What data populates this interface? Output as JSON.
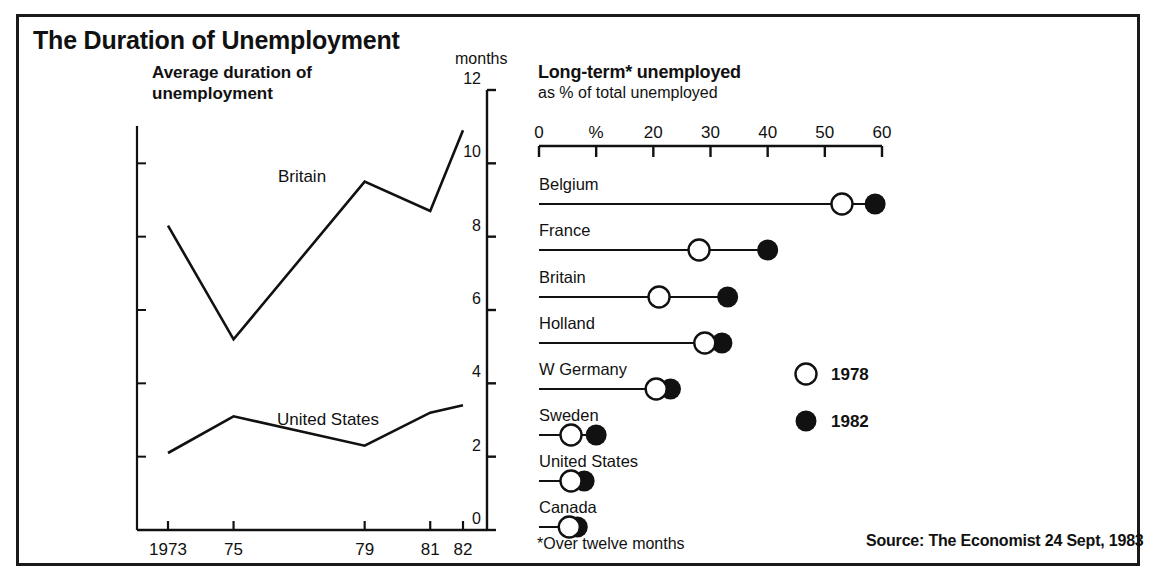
{
  "figure": {
    "title": "The Duration of Unemployment",
    "footnote": "*Over twelve months",
    "source": "Source: The Economist 24 Sept, 1983"
  },
  "left_panel": {
    "subtitle_line1": "Average duration of",
    "subtitle_line2": "unemployment",
    "units_label": "months"
  },
  "right_panel": {
    "title": "Long-term* unemployed",
    "subtitle": "as % of total unemployed",
    "legend": [
      {
        "marker": "open-circle",
        "label": "1978"
      },
      {
        "marker": "filled-circle",
        "label": "1982"
      }
    ]
  },
  "chart_data": [
    {
      "type": "line",
      "title": "Average duration of unemployment",
      "xlabel": "",
      "ylabel": "months",
      "ylim": [
        0,
        12
      ],
      "yticks": [
        0,
        2,
        4,
        6,
        8,
        10,
        12
      ],
      "ytick_labels": [
        "0",
        "2",
        "4",
        "6",
        "8",
        "10",
        "12"
      ],
      "x": [
        1973,
        1975,
        1979,
        1981,
        1982
      ],
      "xtick_labels": [
        "1973",
        "75",
        "79",
        "81",
        "82"
      ],
      "grid": false,
      "axis_position": "right",
      "series": [
        {
          "name": "Britain",
          "values": [
            8.3,
            5.2,
            9.5,
            8.7,
            10.9
          ]
        },
        {
          "name": "United States",
          "values": [
            2.1,
            3.1,
            2.3,
            3.2,
            3.4
          ]
        }
      ],
      "annotations": [
        "Britain",
        "United States"
      ]
    },
    {
      "type": "scatter",
      "title": "Long-term* unemployed",
      "subtitle": "as % of total unemployed",
      "xlabel": "%",
      "xlim": [
        0,
        60
      ],
      "xticks": [
        0,
        10,
        20,
        30,
        40,
        50,
        60
      ],
      "xtick_labels": [
        "0",
        "%",
        "20",
        "30",
        "40",
        "50",
        "60"
      ],
      "legend_position": "center-right",
      "categories": [
        "Belgium",
        "France",
        "Britain",
        "Holland",
        "W Germany",
        "Sweden",
        "United States",
        "Canada"
      ],
      "series": [
        {
          "name": "1978",
          "marker": "open-circle",
          "values": [
            53,
            28,
            21,
            29,
            20.5,
            5.6,
            5.6,
            5.3
          ]
        },
        {
          "name": "1982",
          "marker": "filled-circle",
          "values": [
            58.8,
            40,
            33,
            32,
            23,
            10,
            7.9,
            6.7
          ]
        }
      ]
    }
  ],
  "colors": {
    "ink": "#111111",
    "frame": "#1a1a1a",
    "background": "#ffffff"
  }
}
